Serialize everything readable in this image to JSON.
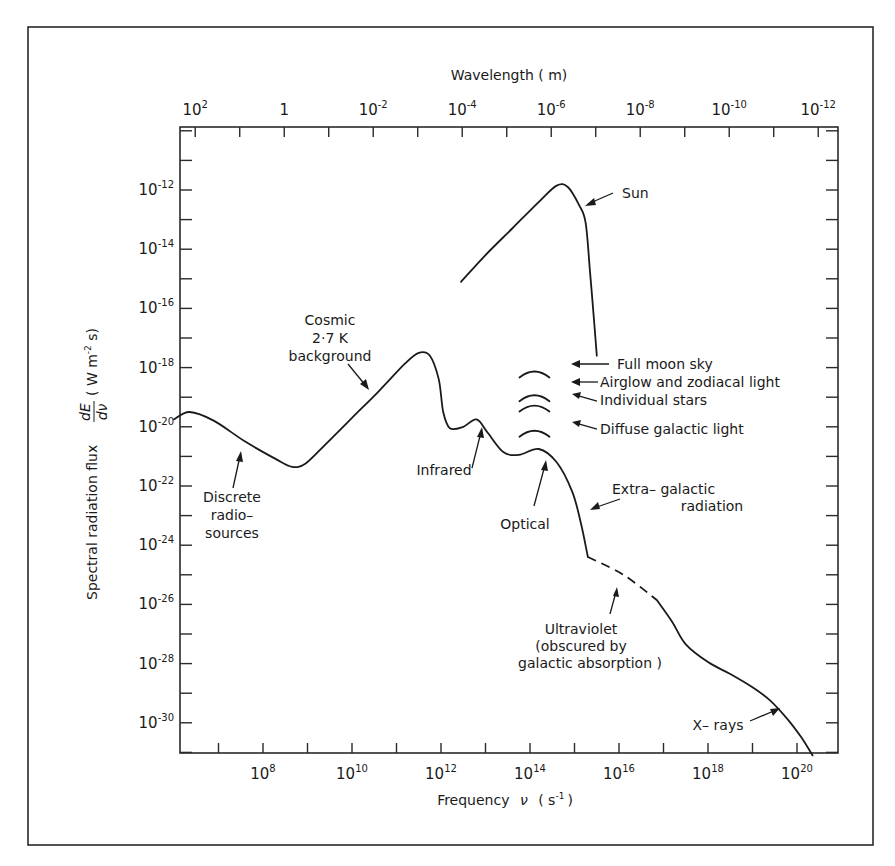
{
  "chart_data": {
    "type": "line",
    "title": "",
    "xlabel": "Frequency ν (s⁻¹)",
    "ylabel": "Spectral radiation flux dE/dν (W m⁻² s)",
    "x2label": "Wavelength (m)",
    "x_scale": "log",
    "y_scale": "log",
    "xlim_log10": [
      6.0,
      20.9
    ],
    "ylim_log10": [
      -31.1,
      -10.1
    ],
    "grid": false,
    "legend": "none (inline annotations)",
    "x_ticks": [
      {
        "exp": 8,
        "label": "10",
        "sup": "8"
      },
      {
        "exp": 10,
        "label": "10",
        "sup": "10"
      },
      {
        "exp": 12,
        "label": "10",
        "sup": "12"
      },
      {
        "exp": 14,
        "label": "10",
        "sup": "14"
      },
      {
        "exp": 16,
        "label": "10",
        "sup": "16"
      },
      {
        "exp": 18,
        "label": "10",
        "sup": "18"
      },
      {
        "exp": 20,
        "label": "10",
        "sup": "20"
      }
    ],
    "x_minor_tick_exps": [
      7,
      9,
      11,
      13,
      15,
      17,
      19
    ],
    "x2_ticks": [
      {
        "wavelength_exp": 2,
        "label": "10",
        "sup": "2"
      },
      {
        "wavelength_exp": 0,
        "label": "1",
        "sup": ""
      },
      {
        "wavelength_exp": -2,
        "label": "10",
        "sup": "-2"
      },
      {
        "wavelength_exp": -4,
        "label": "10",
        "sup": "-4"
      },
      {
        "wavelength_exp": -6,
        "label": "10",
        "sup": "-6"
      },
      {
        "wavelength_exp": -8,
        "label": "10",
        "sup": "-8"
      },
      {
        "wavelength_exp": -10,
        "label": "10",
        "sup": "-10"
      },
      {
        "wavelength_exp": -12,
        "label": "10",
        "sup": "-12"
      }
    ],
    "y_ticks": [
      {
        "exp": -12,
        "label": "10",
        "sup": "-12"
      },
      {
        "exp": -14,
        "label": "10",
        "sup": "-14"
      },
      {
        "exp": -16,
        "label": "10",
        "sup": "-16"
      },
      {
        "exp": -18,
        "label": "10",
        "sup": "-18"
      },
      {
        "exp": -20,
        "label": "10",
        "sup": "-20"
      },
      {
        "exp": -22,
        "label": "10",
        "sup": "-22"
      },
      {
        "exp": -24,
        "label": "10",
        "sup": "-24"
      },
      {
        "exp": -26,
        "label": "10",
        "sup": "-26"
      },
      {
        "exp": -28,
        "label": "10",
        "sup": "-28"
      },
      {
        "exp": -30,
        "label": "10",
        "sup": "-30"
      }
    ],
    "series": [
      {
        "name": "Background radiation spectrum",
        "style": "solid",
        "points_log10": [
          [
            6.0,
            -19.75
          ],
          [
            6.35,
            -19.5
          ],
          [
            6.9,
            -19.8
          ],
          [
            7.6,
            -20.5
          ],
          [
            8.3,
            -21.1
          ],
          [
            8.65,
            -21.35
          ],
          [
            8.95,
            -21.25
          ],
          [
            9.4,
            -20.6
          ],
          [
            10.0,
            -19.7
          ],
          [
            10.6,
            -18.8
          ],
          [
            11.2,
            -17.85
          ],
          [
            11.5,
            -17.5
          ],
          [
            11.75,
            -17.6
          ],
          [
            11.95,
            -18.4
          ],
          [
            12.05,
            -19.5
          ],
          [
            12.2,
            -20.05
          ],
          [
            12.5,
            -20.0
          ],
          [
            12.8,
            -19.75
          ],
          [
            13.05,
            -20.2
          ],
          [
            13.4,
            -20.85
          ],
          [
            13.75,
            -20.95
          ],
          [
            14.2,
            -20.75
          ],
          [
            14.6,
            -21.2
          ],
          [
            14.95,
            -22.2
          ],
          [
            15.15,
            -23.3
          ],
          [
            15.3,
            -24.4
          ]
        ]
      },
      {
        "name": "Ultraviolet (obscured by galactic absorption)",
        "style": "dashed",
        "points_log10": [
          [
            15.3,
            -24.4
          ],
          [
            16.1,
            -25.0
          ],
          [
            16.85,
            -25.85
          ]
        ]
      },
      {
        "name": "X-ray continuation",
        "style": "solid",
        "points_log10": [
          [
            16.85,
            -25.85
          ],
          [
            17.2,
            -26.6
          ],
          [
            17.5,
            -27.35
          ],
          [
            18.0,
            -27.95
          ],
          [
            18.5,
            -28.35
          ],
          [
            19.0,
            -28.8
          ],
          [
            19.4,
            -29.25
          ],
          [
            19.8,
            -29.9
          ],
          [
            20.1,
            -30.5
          ],
          [
            20.35,
            -31.1
          ]
        ]
      },
      {
        "name": "Sun",
        "style": "solid",
        "points_log10": [
          [
            12.45,
            -15.1
          ],
          [
            13.0,
            -14.2
          ],
          [
            13.6,
            -13.3
          ],
          [
            14.2,
            -12.4
          ],
          [
            14.6,
            -11.85
          ],
          [
            14.85,
            -11.9
          ],
          [
            15.1,
            -12.5
          ],
          [
            15.25,
            -13.1
          ],
          [
            15.35,
            -14.8
          ],
          [
            15.45,
            -16.6
          ],
          [
            15.5,
            -17.6
          ]
        ]
      }
    ],
    "sky_arcs": [
      {
        "name": "Full moon sky",
        "log_nu_center": 14.1,
        "log_flux": -18.2
      },
      {
        "name": "Airglow and zodiacal light",
        "log_nu_center": 14.1,
        "log_flux": -19.0
      },
      {
        "name": "Individual stars",
        "log_nu_center": 14.1,
        "log_flux": -19.35
      },
      {
        "name": "Diffuse galactic light",
        "log_nu_center": 14.1,
        "log_flux": -20.2
      }
    ],
    "annotations": [
      {
        "id": "sun",
        "lines": [
          "Sun"
        ]
      },
      {
        "id": "cmb",
        "lines": [
          "Cosmic",
          "2·7 K",
          "background"
        ]
      },
      {
        "id": "radio",
        "lines": [
          "Discrete",
          "radio–",
          "sources"
        ]
      },
      {
        "id": "infrared",
        "lines": [
          "Infrared"
        ]
      },
      {
        "id": "optical",
        "lines": [
          "Optical"
        ]
      },
      {
        "id": "extragalactic",
        "lines": [
          "Extra– galactic",
          "radiation"
        ]
      },
      {
        "id": "uv",
        "lines": [
          "Ultraviolet",
          "(obscured by",
          "galactic absorption )"
        ]
      },
      {
        "id": "xrays",
        "lines": [
          "X– rays"
        ]
      },
      {
        "id": "moon",
        "lines": [
          "Full moon sky"
        ]
      },
      {
        "id": "airglow",
        "lines": [
          "Airglow and zodiacal light"
        ]
      },
      {
        "id": "stars",
        "lines": [
          "Individual stars"
        ]
      },
      {
        "id": "diffuse",
        "lines": [
          "Diffuse galactic light"
        ]
      }
    ]
  },
  "labels": {
    "x_title_main": "Frequency",
    "x_title_sym": "ν",
    "x_title_unit_open": "( s",
    "x_title_unit_sup": "-1",
    "x_title_unit_close": ")",
    "x2_title": "Wavelength  ( m)",
    "y_title_text": "Spectral  radiation  flux",
    "y_title_frac_num": "dE",
    "y_title_frac_den": "dν",
    "y_title_unit": "( W  m",
    "y_title_unit_sup": "-2",
    "y_title_unit_end": " s)"
  }
}
